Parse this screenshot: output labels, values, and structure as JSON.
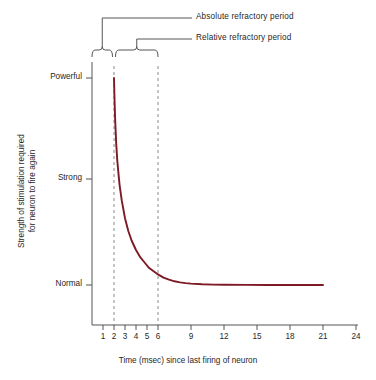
{
  "chart_data": {
    "type": "line",
    "title": "",
    "xlabel": "Time (msec) since last firing of neuron",
    "ylabel": "Strength of stimulation required for neuron to fire again",
    "ylabel_line1": "Strength of stimulation required",
    "ylabel_line2": "for neuron to fire again",
    "xlim": [
      0,
      24
    ],
    "ylim": [
      0,
      3
    ],
    "grid": false,
    "legend_position": "none",
    "line_color": "#7d1a25",
    "axis_color": "#555555",
    "xticks": [
      1,
      2,
      3,
      4,
      5,
      6,
      9,
      12,
      15,
      18,
      21,
      24
    ],
    "xtick_labels": [
      "1",
      "2",
      "3",
      "4",
      "5",
      "6",
      "9",
      "12",
      "15",
      "18",
      "21",
      "24"
    ],
    "yticks": [
      1,
      2,
      3
    ],
    "ytick_labels": [
      "Normal",
      "Strong",
      "Powerful"
    ],
    "series": [
      {
        "name": "Stimulation threshold",
        "x": [
          2.0,
          2.05,
          2.1,
          2.2,
          2.3,
          2.5,
          2.7,
          3.0,
          3.3,
          3.6,
          4.0,
          4.4,
          4.8,
          5.2,
          5.6,
          6.0,
          6.5,
          7.0,
          7.5,
          8.0,
          8.5,
          9.0,
          10.0,
          11.0,
          12.0,
          14.0,
          16.0,
          18.0,
          21.0
        ],
        "y": [
          3.0,
          2.78,
          2.6,
          2.35,
          2.18,
          1.95,
          1.8,
          1.63,
          1.51,
          1.42,
          1.33,
          1.26,
          1.21,
          1.16,
          1.13,
          1.1,
          1.07,
          1.05,
          1.035,
          1.025,
          1.018,
          1.013,
          1.007,
          1.004,
          1.002,
          1.001,
          1.0,
          1.0,
          1.0
        ]
      }
    ],
    "annotations": [
      {
        "name": "absolute-refractory-period",
        "label": "Absolute refractory period",
        "span_start": 0.0,
        "span_end": 2.0
      },
      {
        "name": "relative-refractory-period",
        "label": "Relative refractory period",
        "span_start": 2.0,
        "span_end": 6.0
      }
    ],
    "reference_lines": [
      {
        "name": "absolute-period-end",
        "x": 2,
        "style": "dashed"
      },
      {
        "name": "relative-period-end",
        "x": 6,
        "style": "dashed"
      }
    ]
  }
}
